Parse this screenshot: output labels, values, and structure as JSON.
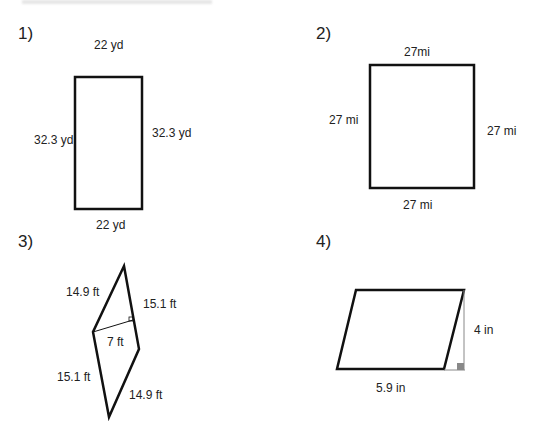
{
  "problems": [
    {
      "number": "1)",
      "shape": "rectangle",
      "labels": {
        "top": "22 yd",
        "left": "32.3 yd",
        "right": "32.3 yd",
        "bottom": "22 yd"
      }
    },
    {
      "number": "2)",
      "shape": "square",
      "labels": {
        "top": "27mi",
        "left": "27 mi",
        "right": "27 mi",
        "bottom": "27 mi"
      }
    },
    {
      "number": "3)",
      "shape": "rhombus",
      "labels": {
        "top_left": "14.9 ft",
        "top_right": "15.1 ft",
        "height": "7 ft",
        "bottom_left": "15.1 ft",
        "bottom_right": "14.9 ft"
      }
    },
    {
      "number": "4)",
      "shape": "parallelogram",
      "labels": {
        "height": "4 in",
        "base": "5.9 in"
      }
    }
  ],
  "colors": {
    "stroke": "#111111",
    "height_line": "#888888",
    "right_angle_fill": "#888888"
  }
}
